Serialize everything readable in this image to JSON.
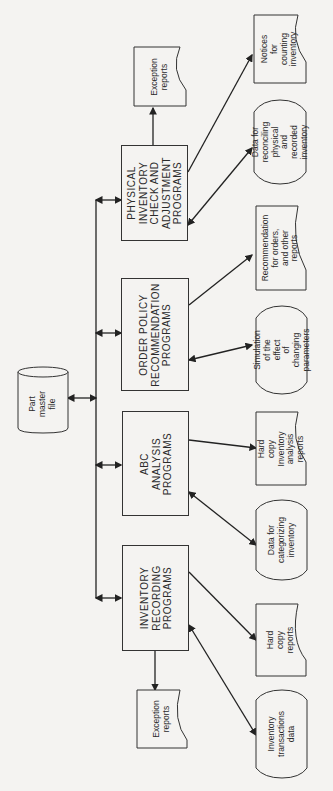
{
  "diagram": {
    "central": {
      "label": "Part\nmaster\nfile",
      "shape": "cylinder"
    },
    "programs": [
      {
        "label": "INVENTORY\nRECORDING\nPROGRAMS"
      },
      {
        "label": "ABC\nANALYSIS\nPROGRAMS"
      },
      {
        "label": "ORDER POLICY\nRECOMMENDATION\nPROGRAMS"
      },
      {
        "label": "PHYSICAL\nINVENTORY\nCHECK AND\nADJUSTMENT\nPROGRAMS"
      }
    ],
    "outputs": [
      {
        "label": "Exception\nreports",
        "shape": "document",
        "from": "INVENTORY RECORDING PROGRAMS"
      },
      {
        "label": "Inventory\ntransactions\ndata",
        "shape": "display",
        "from": "INVENTORY RECORDING PROGRAMS"
      },
      {
        "label": "Hard copy\nreports",
        "shape": "document",
        "from": "INVENTORY RECORDING PROGRAMS"
      },
      {
        "label": "Data for\ncategorizing\ninventory",
        "shape": "display",
        "from": "ABC ANALYSIS PROGRAMS"
      },
      {
        "label": "Hard copy\nInventory\nanalysis\nreports",
        "shape": "document",
        "from": "ABC ANALYSIS PROGRAMS"
      },
      {
        "label": "Simulation\nof the effect\nof changing\nparameters",
        "shape": "display",
        "from": "ORDER POLICY RECOMMENDATION PROGRAMS"
      },
      {
        "label": "Recommendation\nfor orders,\nand other\nreports",
        "shape": "document",
        "from": "ORDER POLICY RECOMMENDATION PROGRAMS"
      },
      {
        "label": "Data for\nreconciling\nphysical and\nrecorded\ninventory",
        "shape": "display",
        "from": "PHYSICAL INVENTORY CHECK AND ADJUSTMENT PROGRAMS"
      },
      {
        "label": "Notices for\ncounting\ninventory",
        "shape": "document",
        "from": "PHYSICAL INVENTORY CHECK AND ADJUSTMENT PROGRAMS"
      },
      {
        "label": "Exception\nreports",
        "shape": "document",
        "from": "PHYSICAL INVENTORY CHECK AND ADJUSTMENT PROGRAMS"
      }
    ]
  }
}
